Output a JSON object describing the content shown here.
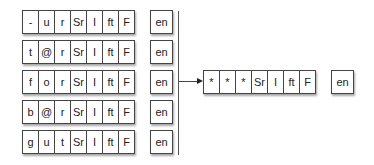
{
  "diagram": {
    "inputs": [
      {
        "cells": [
          "-",
          "u",
          "r",
          "Sr",
          "I",
          "ft",
          "F"
        ],
        "tag": "en"
      },
      {
        "cells": [
          "t",
          "@",
          "r",
          "Sr",
          "I",
          "ft",
          "F"
        ],
        "tag": "en"
      },
      {
        "cells": [
          "f",
          "o",
          "r",
          "Sr",
          "I",
          "ft",
          "F"
        ],
        "tag": "en"
      },
      {
        "cells": [
          "b",
          "@",
          "r",
          "Sr",
          "I",
          "ft",
          "F"
        ],
        "tag": "en"
      },
      {
        "cells": [
          "g",
          "u",
          "t",
          "Sr",
          "I",
          "ft",
          "F"
        ],
        "tag": "en"
      }
    ],
    "output": {
      "cells": [
        "*",
        "*",
        "*",
        "Sr",
        "I",
        "ft",
        "F"
      ],
      "tag": "en"
    },
    "connector": {
      "type": "bracket-arrow",
      "direction": "right"
    }
  }
}
